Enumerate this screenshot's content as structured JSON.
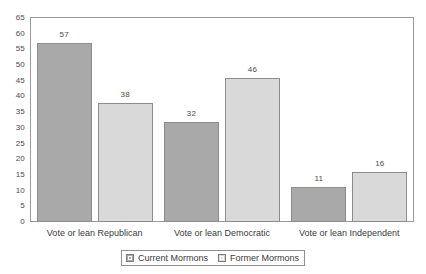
{
  "chart_data": {
    "type": "bar",
    "title": "",
    "xlabel": "",
    "ylabel": "",
    "ylim": [
      0,
      65
    ],
    "ytick_step": 5,
    "grid": false,
    "legend_position": "bottom-center",
    "categories": [
      "Vote or lean Republican",
      "Vote or lean Democratic",
      "Vote or lean Independent"
    ],
    "yticks": [
      "0",
      "5",
      "10",
      "15",
      "20",
      "25",
      "30",
      "35",
      "40",
      "45",
      "50",
      "55",
      "60",
      "65"
    ],
    "series": [
      {
        "name": "Current Mormons",
        "color": "#a9a9a9",
        "values": [
          57,
          32,
          11
        ]
      },
      {
        "name": "Former Mormons",
        "color": "#d9d9d9",
        "values": [
          38,
          46,
          16
        ]
      }
    ]
  },
  "legend": {
    "entries": [
      {
        "label": "Current Mormons"
      },
      {
        "label": "Former Mormons"
      }
    ]
  },
  "colors": {
    "series_current": "#a9a9a9",
    "series_former": "#d9d9d9",
    "frame": "#9a9a9a",
    "text": "#3a3a3a",
    "background": "#ffffff"
  }
}
